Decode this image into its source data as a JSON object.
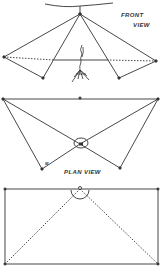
{
  "figure": {
    "panels": [
      {
        "id": "front",
        "label_line1": "FRONT",
        "label_line2": "VIEW"
      },
      {
        "id": "plan",
        "label": "PLAN VIEW",
        "marker": "M"
      },
      {
        "id": "bottom",
        "label": ""
      }
    ],
    "colors": {
      "ink": "#333333",
      "background": "#ffffff"
    }
  }
}
